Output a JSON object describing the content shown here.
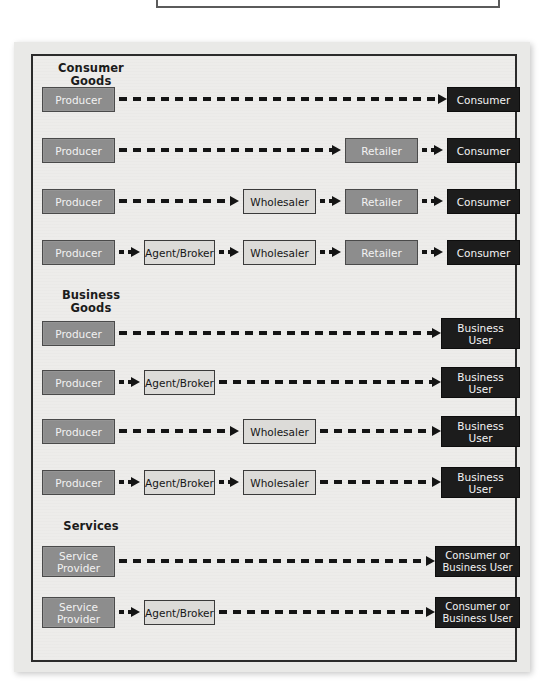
{
  "diagram": {
    "colors": {
      "plate_background": "#e9e9e7",
      "frame_background": "#edecea",
      "frame_border": "#2b2b2b",
      "producer_fill": "#8d8d8d",
      "intermediary_mid_fill": "#8d8d8d",
      "intermediary_light_fill": "#dcdbd8",
      "endpoint_fill": "#1c1c1c",
      "arrow": "#141414"
    },
    "sections": [
      {
        "id": "consumer-goods",
        "heading": "Consumer\nGoods",
        "rows": [
          {
            "id": "cg-row-1",
            "nodes": [
              "Producer",
              "Consumer"
            ]
          },
          {
            "id": "cg-row-2",
            "nodes": [
              "Producer",
              "Retailer",
              "Consumer"
            ]
          },
          {
            "id": "cg-row-3",
            "nodes": [
              "Producer",
              "Wholesaler",
              "Retailer",
              "Consumer"
            ]
          },
          {
            "id": "cg-row-4",
            "nodes": [
              "Producer",
              "Agent/Broker",
              "Wholesaler",
              "Retailer",
              "Consumer"
            ]
          }
        ]
      },
      {
        "id": "business-goods",
        "heading": "Business\nGoods",
        "rows": [
          {
            "id": "bg-row-1",
            "nodes": [
              "Producer",
              "Business\nUser"
            ]
          },
          {
            "id": "bg-row-2",
            "nodes": [
              "Producer",
              "Agent/Broker",
              "Business\nUser"
            ]
          },
          {
            "id": "bg-row-3",
            "nodes": [
              "Producer",
              "Wholesaler",
              "Business\nUser"
            ]
          },
          {
            "id": "bg-row-4",
            "nodes": [
              "Producer",
              "Agent/Broker",
              "Wholesaler",
              "Business\nUser"
            ]
          }
        ]
      },
      {
        "id": "services",
        "heading": "Services",
        "rows": [
          {
            "id": "sv-row-1",
            "nodes": [
              "Service\nProvider",
              "Consumer or\nBusiness User"
            ]
          },
          {
            "id": "sv-row-2",
            "nodes": [
              "Service\nProvider",
              "Agent/Broker",
              "Consumer or\nBusiness User"
            ]
          }
        ]
      }
    ],
    "labels": {
      "producer": "Producer",
      "service_provider": "Service\nProvider",
      "agent_broker": "Agent/Broker",
      "wholesaler": "Wholesaler",
      "retailer": "Retailer",
      "consumer": "Consumer",
      "business_user": "Business\nUser",
      "consumer_or_business_user": "Consumer or\nBusiness User"
    }
  }
}
